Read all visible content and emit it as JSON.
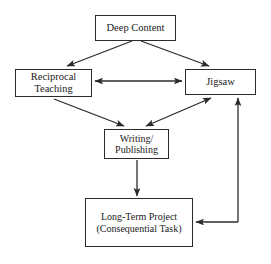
{
  "diagram": {
    "stroke_color": "#2b2b2b",
    "background_color": "#ffffff",
    "nodes": [
      {
        "id": "deep-content",
        "lines": [
          "Deep Content"
        ]
      },
      {
        "id": "reciprocal-teaching",
        "lines": [
          "Reciprocal",
          "Teaching"
        ]
      },
      {
        "id": "jigsaw",
        "lines": [
          "Jigsaw"
        ]
      },
      {
        "id": "writing-publishing",
        "lines": [
          "Writing/",
          "Publishing"
        ]
      },
      {
        "id": "long-term-project",
        "lines": [
          "Long-Term Project",
          "(Consequential Task)"
        ]
      }
    ],
    "edges": [
      {
        "id": "deep-content-to-reciprocal-teaching",
        "from": "deep-content",
        "to": "reciprocal-teaching",
        "direction": "one-way"
      },
      {
        "id": "deep-content-to-jigsaw",
        "from": "deep-content",
        "to": "jigsaw",
        "direction": "one-way"
      },
      {
        "id": "reciprocal-teaching-to-jigsaw",
        "from": "reciprocal-teaching",
        "to": "jigsaw",
        "direction": "two-way"
      },
      {
        "id": "reciprocal-teaching-to-writing",
        "from": "reciprocal-teaching",
        "to": "writing-publishing",
        "direction": "one-way"
      },
      {
        "id": "writing-to-jigsaw",
        "from": "writing-publishing",
        "to": "jigsaw",
        "direction": "two-way"
      },
      {
        "id": "writing-to-long-term-project",
        "from": "writing-publishing",
        "to": "long-term-project",
        "direction": "one-way"
      },
      {
        "id": "long-term-project-to-jigsaw",
        "from": "long-term-project",
        "to": "jigsaw",
        "direction": "one-way"
      },
      {
        "id": "jigsaw-to-long-term-project",
        "from": "jigsaw",
        "to": "long-term-project",
        "direction": "one-way"
      }
    ]
  }
}
